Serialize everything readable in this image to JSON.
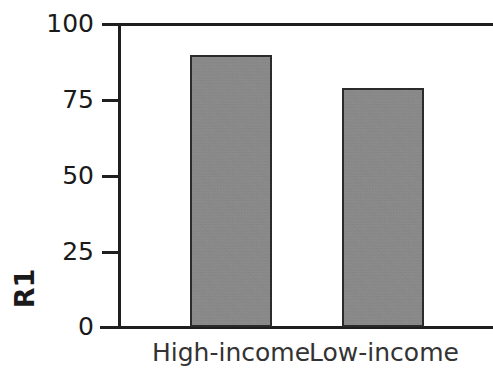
{
  "chart_data": {
    "type": "bar",
    "title": "",
    "subtitle": "",
    "xlabel": "",
    "ylabel": "R1",
    "categories": [
      "High-income",
      "Low-income"
    ],
    "values": [
      90,
      79
    ],
    "series": [
      {
        "name": "R1",
        "values": [
          90,
          79
        ]
      }
    ],
    "ylim": [
      0,
      100
    ],
    "y_ticks": [
      0,
      25,
      50,
      75,
      100
    ],
    "y_tick_labels": [
      "0",
      "25",
      "50",
      "75",
      "100"
    ],
    "grid": false,
    "legend": false,
    "legend_position": "none",
    "bar_fill_color": "#8d8d8d",
    "bar_edge_color": "#2b2b2b",
    "axis_color": "#1f1f1f",
    "text_color": "#1a1a1a",
    "background_color": "#ffffff",
    "annotations": []
  },
  "axis": {
    "y_title": "R1",
    "ticks": [
      {
        "label": "100",
        "value": 100
      },
      {
        "label": "75",
        "value": 75
      },
      {
        "label": "50",
        "value": 50
      },
      {
        "label": "25",
        "value": 25
      },
      {
        "label": "0",
        "value": 0
      }
    ]
  },
  "bars": [
    {
      "label": "High-income",
      "value": 90
    },
    {
      "label": "Low-income",
      "value": 79
    }
  ]
}
